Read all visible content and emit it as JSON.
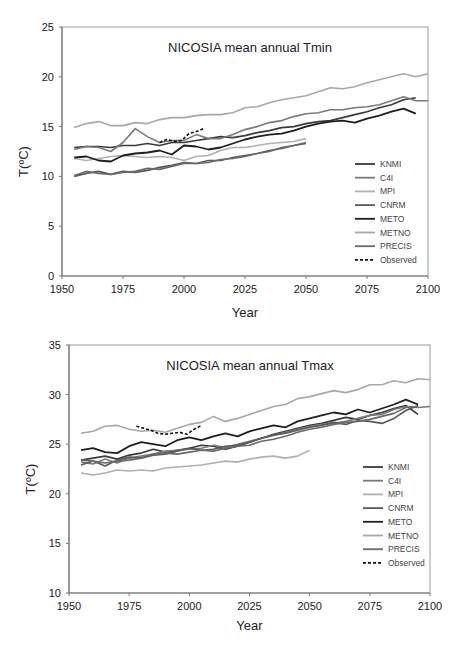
{
  "chart_data": [
    {
      "type": "line",
      "title": "NICOSIA mean annual Tmin",
      "xlabel": "Year",
      "ylabel": "T(ºC)",
      "xlim": [
        1950,
        2100
      ],
      "ylim": [
        0,
        25
      ],
      "xticks": [
        1950,
        1975,
        2000,
        2025,
        2050,
        2075,
        2100
      ],
      "yticks": [
        0,
        5,
        10,
        15,
        20,
        25
      ],
      "grid": false,
      "legend_position": "lower right inside",
      "series": [
        {
          "name": "KNMI",
          "color": "#3a3a3a",
          "dash": false,
          "x": [
            1955,
            1960,
            1965,
            1970,
            1975,
            1980,
            1985,
            1990,
            1995,
            2000,
            2005,
            2010,
            2015,
            2020,
            2025,
            2030,
            2035,
            2040,
            2045,
            2050,
            2055,
            2060,
            2065,
            2070,
            2075,
            2080,
            2085,
            2090,
            2095
          ],
          "values": [
            12.9,
            13.0,
            13.0,
            12.9,
            13.1,
            13.1,
            13.3,
            13.1,
            13.4,
            13.4,
            13.6,
            13.8,
            14.0,
            13.9,
            14.1,
            14.4,
            14.6,
            14.9,
            15.0,
            15.3,
            15.5,
            15.6,
            15.9,
            16.2,
            16.5,
            16.9,
            17.2,
            17.7,
            17.9
          ]
        },
        {
          "name": "C4I",
          "color": "#7a7a7a",
          "dash": false,
          "x": [
            1955,
            1960,
            1965,
            1970,
            1975,
            1980,
            1985,
            1990,
            1995,
            2000,
            2005,
            2010,
            2015,
            2020,
            2025,
            2030,
            2035,
            2040,
            2045,
            2050,
            2055,
            2060,
            2065,
            2070,
            2075,
            2080,
            2085,
            2090,
            2095,
            2100
          ],
          "values": [
            12.7,
            13.0,
            12.9,
            12.5,
            13.4,
            14.8,
            14.0,
            13.4,
            13.6,
            13.6,
            14.2,
            13.8,
            13.8,
            14.2,
            14.7,
            15.0,
            15.4,
            15.6,
            16.0,
            16.3,
            16.4,
            16.7,
            16.7,
            16.9,
            17.0,
            17.2,
            17.6,
            18.0,
            17.6,
            17.6
          ]
        },
        {
          "name": "MPI",
          "color": "#b0b0b0",
          "dash": false,
          "x": [
            1955,
            1960,
            1965,
            1970,
            1975,
            1980,
            1985,
            1990,
            1995,
            2000,
            2005,
            2010,
            2015,
            2020,
            2025,
            2030,
            2035,
            2040,
            2045,
            2050
          ],
          "values": [
            11.8,
            11.6,
            11.8,
            12.0,
            12.1,
            12.0,
            11.9,
            12.0,
            11.9,
            11.6,
            12.0,
            12.1,
            12.6,
            12.9,
            12.9,
            13.1,
            13.3,
            13.4,
            13.5,
            13.8
          ]
        },
        {
          "name": "CNRM",
          "color": "#5a5a5a",
          "dash": false,
          "x": [
            1955,
            1960,
            1965,
            1970,
            1975,
            1980,
            1985,
            1990,
            1995,
            2000,
            2005,
            2010,
            2015,
            2020,
            2025,
            2030,
            2035,
            2040,
            2045,
            2050
          ],
          "values": [
            10.0,
            10.3,
            10.5,
            10.2,
            10.5,
            10.4,
            10.6,
            10.9,
            11.1,
            11.4,
            11.3,
            11.6,
            11.6,
            11.9,
            12.1,
            12.3,
            12.6,
            12.8,
            13.1,
            13.3
          ]
        },
        {
          "name": "METO",
          "color": "#1e1e1e",
          "dash": false,
          "x": [
            1955,
            1960,
            1965,
            1970,
            1975,
            1980,
            1985,
            1990,
            1995,
            2000,
            2005,
            2010,
            2015,
            2020,
            2025,
            2030,
            2035,
            2040,
            2045,
            2050,
            2055,
            2060,
            2065,
            2070,
            2075,
            2080,
            2085,
            2090,
            2095
          ],
          "values": [
            11.9,
            12.0,
            11.6,
            11.5,
            12.1,
            12.3,
            12.4,
            12.6,
            12.2,
            13.1,
            13.0,
            12.7,
            12.9,
            13.3,
            13.7,
            14.0,
            14.2,
            14.3,
            14.6,
            15.0,
            15.3,
            15.5,
            15.6,
            15.4,
            15.8,
            16.1,
            16.5,
            16.8,
            16.3
          ]
        },
        {
          "name": "METNO",
          "color": "#a8a8a8",
          "dash": false,
          "x": [
            1955,
            1960,
            1965,
            1970,
            1975,
            1980,
            1985,
            1990,
            1995,
            2000,
            2005,
            2010,
            2015,
            2020,
            2025,
            2030,
            2035,
            2040,
            2045,
            2050,
            2055,
            2060,
            2065,
            2070,
            2075,
            2080,
            2085,
            2090,
            2095,
            2100
          ],
          "values": [
            14.9,
            15.3,
            15.5,
            15.1,
            15.1,
            15.4,
            15.3,
            15.7,
            15.9,
            15.9,
            16.1,
            16.2,
            16.2,
            16.4,
            16.9,
            17.0,
            17.4,
            17.7,
            17.9,
            18.1,
            18.5,
            18.9,
            18.8,
            19.0,
            19.4,
            19.7,
            20.0,
            20.3,
            20.0,
            20.3
          ]
        },
        {
          "name": "PRECIS",
          "color": "#6a6a6a",
          "dash": false,
          "x": [
            1955,
            1960,
            1965,
            1970,
            1975,
            1980,
            1985,
            1990,
            1995,
            2000,
            2005,
            2010,
            2015,
            2020,
            2025,
            2030,
            2035,
            2040,
            2045,
            2050
          ],
          "values": [
            10.1,
            10.5,
            10.3,
            10.2,
            10.4,
            10.5,
            10.8,
            10.7,
            11.0,
            11.3,
            11.3,
            11.4,
            11.7,
            11.8,
            12.0,
            12.3,
            12.5,
            12.9,
            13.1,
            13.4
          ]
        },
        {
          "name": "Observed",
          "color": "#111111",
          "dash": true,
          "x": [
            1990,
            1993,
            1996,
            1999,
            2002,
            2005,
            2008
          ],
          "values": [
            13.4,
            13.7,
            13.5,
            13.6,
            14.3,
            14.5,
            14.8
          ]
        }
      ]
    },
    {
      "type": "line",
      "title": "NICOSIA mean annual Tmax",
      "xlabel": "Year",
      "ylabel": "T(ºC)",
      "xlim": [
        1950,
        2100
      ],
      "ylim": [
        10,
        35
      ],
      "xticks": [
        1950,
        1975,
        2000,
        2025,
        2050,
        2075,
        2100
      ],
      "yticks": [
        10,
        15,
        20,
        25,
        30,
        35
      ],
      "grid": false,
      "legend_position": "lower right inside",
      "series": [
        {
          "name": "KNMI",
          "color": "#3a3a3a",
          "dash": false,
          "x": [
            1955,
            1960,
            1965,
            1970,
            1975,
            1980,
            1985,
            1990,
            1995,
            2000,
            2005,
            2010,
            2015,
            2020,
            2025,
            2030,
            2035,
            2040,
            2045,
            2050,
            2055,
            2060,
            2065,
            2070,
            2075,
            2080,
            2085,
            2090,
            2095
          ],
          "values": [
            23.4,
            23.6,
            23.8,
            23.5,
            23.9,
            24.1,
            24.5,
            24.2,
            24.4,
            24.6,
            24.9,
            24.8,
            24.5,
            24.8,
            25.2,
            25.6,
            26.0,
            26.3,
            26.6,
            26.9,
            27.1,
            27.4,
            27.7,
            27.5,
            27.9,
            28.2,
            28.6,
            28.9,
            28.0
          ]
        },
        {
          "name": "C4I",
          "color": "#7a7a7a",
          "dash": false,
          "x": [
            1955,
            1960,
            1965,
            1970,
            1975,
            1980,
            1985,
            1990,
            1995,
            2000,
            2005,
            2010,
            2015,
            2020,
            2025,
            2030,
            2035,
            2040,
            2045,
            2050,
            2055,
            2060,
            2065,
            2070,
            2075,
            2080,
            2085,
            2090,
            2095,
            2100
          ],
          "values": [
            23.2,
            23.0,
            23.5,
            23.1,
            23.6,
            23.8,
            24.0,
            24.3,
            24.4,
            24.5,
            24.6,
            24.9,
            24.7,
            25.0,
            25.3,
            25.6,
            25.9,
            26.2,
            26.5,
            26.8,
            27.0,
            27.1,
            27.3,
            27.6,
            27.9,
            28.0,
            28.5,
            28.8,
            28.7,
            28.8
          ]
        },
        {
          "name": "MPI",
          "color": "#b0b0b0",
          "dash": false,
          "x": [
            1955,
            1960,
            1965,
            1970,
            1975,
            1980,
            1985,
            1990,
            1995,
            2000,
            2005,
            2010,
            2015,
            2020,
            2025,
            2030,
            2035,
            2040,
            2045,
            2050
          ],
          "values": [
            22.1,
            21.9,
            22.1,
            22.4,
            22.3,
            22.4,
            22.3,
            22.6,
            22.7,
            22.8,
            22.9,
            23.1,
            23.3,
            23.2,
            23.5,
            23.7,
            23.8,
            23.6,
            23.8,
            24.4
          ]
        },
        {
          "name": "CNRM",
          "color": "#5a5a5a",
          "dash": false,
          "x": [
            1955,
            1960,
            1965,
            1970,
            1975,
            1980,
            1985,
            1990,
            1995,
            2000,
            2005,
            2010,
            2015,
            2020,
            2025,
            2030,
            2035,
            2040,
            2045,
            2050,
            2055,
            2060,
            2065,
            2070,
            2075,
            2080,
            2085,
            2090,
            2095
          ],
          "values": [
            22.9,
            23.3,
            22.8,
            23.4,
            23.7,
            23.6,
            23.9,
            24.0,
            24.3,
            24.6,
            24.4,
            24.5,
            24.8,
            24.9,
            25.2,
            25.6,
            25.9,
            26.1,
            26.4,
            26.7,
            26.9,
            27.2,
            27.0,
            27.4,
            27.3,
            27.1,
            27.6,
            28.4,
            28.9
          ]
        },
        {
          "name": "METO",
          "color": "#1e1e1e",
          "dash": false,
          "x": [
            1955,
            1960,
            1965,
            1970,
            1975,
            1980,
            1985,
            1990,
            1995,
            2000,
            2005,
            2010,
            2015,
            2020,
            2025,
            2030,
            2035,
            2040,
            2045,
            2050,
            2055,
            2060,
            2065,
            2070,
            2075,
            2080,
            2085,
            2090,
            2095
          ],
          "values": [
            24.4,
            24.6,
            24.2,
            24.1,
            24.8,
            25.2,
            25.0,
            24.8,
            25.4,
            25.7,
            25.4,
            25.8,
            26.1,
            25.8,
            26.3,
            26.6,
            26.9,
            26.7,
            27.3,
            27.6,
            27.9,
            28.2,
            28.0,
            28.5,
            28.2,
            28.6,
            29.0,
            29.5,
            29.0
          ]
        },
        {
          "name": "METNO",
          "color": "#a8a8a8",
          "dash": false,
          "x": [
            1955,
            1960,
            1965,
            1970,
            1975,
            1980,
            1985,
            1990,
            1995,
            2000,
            2005,
            2010,
            2015,
            2020,
            2025,
            2030,
            2035,
            2040,
            2045,
            2050,
            2055,
            2060,
            2065,
            2070,
            2075,
            2080,
            2085,
            2090,
            2095,
            2100
          ],
          "values": [
            26.1,
            26.3,
            26.8,
            26.9,
            26.5,
            26.3,
            26.4,
            26.2,
            26.6,
            27.0,
            27.2,
            27.8,
            27.3,
            27.6,
            28.0,
            28.4,
            28.8,
            29.0,
            29.6,
            29.8,
            30.1,
            30.4,
            30.2,
            30.5,
            31.0,
            31.0,
            31.4,
            31.2,
            31.6,
            31.5
          ]
        },
        {
          "name": "PRECIS",
          "color": "#6a6a6a",
          "dash": false,
          "x": [
            1955,
            1960,
            1965,
            1970,
            1975,
            1980,
            1985,
            1990,
            1995,
            2000,
            2005,
            2010,
            2015,
            2020,
            2025,
            2030,
            2035,
            2040,
            2045,
            2050,
            2055,
            2060,
            2065,
            2070,
            2075,
            2080,
            2085,
            2090,
            2095
          ],
          "values": [
            23.4,
            23.3,
            23.1,
            23.3,
            23.4,
            23.6,
            24.0,
            24.1,
            24.0,
            24.2,
            24.4,
            24.3,
            24.6,
            24.8,
            24.9,
            25.3,
            25.5,
            25.8,
            26.2,
            26.5,
            26.7,
            27.0,
            27.2,
            27.3,
            27.5,
            27.8,
            28.1,
            28.7,
            28.8
          ]
        },
        {
          "name": "Observed",
          "color": "#111111",
          "dash": true,
          "x": [
            1978,
            1981,
            1984,
            1987,
            1990,
            1993,
            1996,
            1999,
            2002,
            2005
          ],
          "values": [
            26.8,
            26.6,
            26.4,
            26.1,
            26.0,
            26.1,
            26.2,
            26.0,
            26.5,
            26.9
          ]
        }
      ]
    }
  ],
  "charts": [
    {
      "title": "NICOSIA mean annual Tmin",
      "xlabel": "Year",
      "ylabel": "T(ºC)"
    },
    {
      "title": "NICOSIA mean annual Tmax",
      "xlabel": "Year",
      "ylabel": "T(ºC)"
    }
  ]
}
